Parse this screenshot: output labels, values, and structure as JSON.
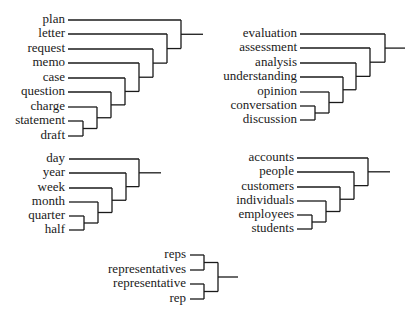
{
  "title": "",
  "dendrograms": [
    {
      "name": "document-nouns",
      "leaves": [
        "plan",
        "letter",
        "request",
        "memo",
        "case",
        "question",
        "charge",
        "statement",
        "draft"
      ],
      "label_right_x": 65,
      "line_start_x": 68,
      "leaf_y": [
        20,
        34,
        49,
        63,
        78,
        92,
        107,
        121,
        136
      ],
      "join_x": [
        83,
        97,
        111,
        125,
        139,
        153,
        167,
        181
      ],
      "stem_end_x": 203,
      "structure": "chain"
    },
    {
      "name": "cognition-nouns",
      "leaves": [
        "evaluation",
        "assessment",
        "analysis",
        "understanding",
        "opinion",
        "conversation",
        "discussion"
      ],
      "label_right_x": 297,
      "line_start_x": 300,
      "leaf_y": [
        34,
        48,
        63,
        77,
        92,
        106,
        120
      ],
      "join_x": [
        315,
        329,
        343,
        356,
        370,
        385
      ],
      "stem_end_x": 405,
      "structure": "chain"
    },
    {
      "name": "time-nouns",
      "leaves": [
        "day",
        "year",
        "week",
        "month",
        "quarter",
        "half"
      ],
      "label_right_x": 65,
      "line_start_x": 69,
      "leaf_y": [
        159,
        173,
        188,
        202,
        216,
        230
      ],
      "join_x": [
        84,
        98,
        112,
        126,
        139
      ],
      "stem_end_x": 161,
      "structure": "chain"
    },
    {
      "name": "people-nouns",
      "leaves": [
        "accounts",
        "people",
        "customers",
        "individuals",
        "employees",
        "students"
      ],
      "label_right_x": 294,
      "line_start_x": 297,
      "leaf_y": [
        158,
        172,
        187,
        201,
        215,
        229
      ],
      "join_x": [
        312,
        326,
        340,
        354,
        368
      ],
      "stem_end_x": 390,
      "structure": "chain"
    },
    {
      "name": "rep-nouns",
      "leaves": [
        "reps",
        "representatives",
        "representative",
        "rep"
      ],
      "label_right_x": 186,
      "line_start_x": 190,
      "leaf_y": [
        255,
        270,
        284,
        299
      ],
      "join_x": [
        204,
        218
      ],
      "stem_end_x": 238,
      "structure": "pairs"
    }
  ]
}
